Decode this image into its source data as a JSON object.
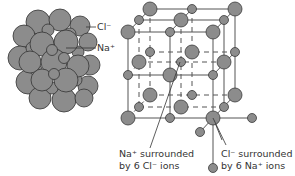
{
  "figure": {
    "close_packed": {
      "label_cl": "Cl⁻",
      "label_na": "Na⁺"
    },
    "lattice": {
      "caption_na_line1": "Na⁺ surrounded",
      "caption_na_line2": "by 6 Cl⁻ ions",
      "caption_cl_line1": "Cl⁻ surrounded",
      "caption_cl_line2": "by 6 Na⁺ ions"
    },
    "colors": {
      "ion_fill": "#8c8c8c",
      "ion_stroke": "#3a3a3a",
      "line": "#555555",
      "text": "#333333"
    }
  }
}
